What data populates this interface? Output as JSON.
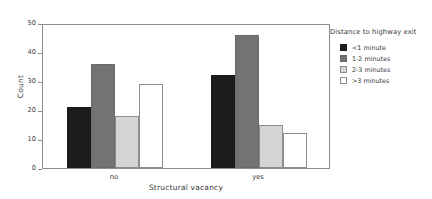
{
  "chart_data": {
    "type": "bar",
    "title": "",
    "xlabel": "Structural vacancy",
    "ylabel": "Count",
    "categories": [
      "no",
      "yes"
    ],
    "series": [
      {
        "name": "<1 minute",
        "color": "#1c1c1c",
        "border": "#1c1c1c",
        "values": [
          21,
          32
        ]
      },
      {
        "name": "1-2 minutes",
        "color": "#737373",
        "border": "#6a6a6a",
        "values": [
          36,
          46
        ]
      },
      {
        "name": "2-3 minutes",
        "color": "#d5d5d5",
        "border": "#8d8d8d",
        "values": [
          18,
          15
        ]
      },
      {
        "name": ">3 minutes",
        "color": "#ffffff",
        "border": "#8d8d8d",
        "values": [
          29,
          12
        ]
      }
    ],
    "ylim": [
      0,
      50
    ],
    "yticks": [
      "0",
      "10",
      "20",
      "30",
      "40",
      "50"
    ],
    "ytick_values": [
      0,
      10,
      20,
      30,
      40,
      50
    ],
    "grid": false,
    "legend": {
      "title": "Distance to highway exit",
      "position": "right",
      "entries": [
        "<1 minute",
        "1-2 minutes",
        "2-3 minutes",
        ">3 minutes"
      ]
    },
    "frame": true,
    "frame_color": "#8d8d8d",
    "background": "#ffffff"
  }
}
